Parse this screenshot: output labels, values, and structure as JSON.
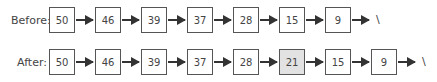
{
  "before": {
    "label": "Before:",
    "nodes": [
      "50",
      "46",
      "39",
      "37",
      "28",
      "15",
      "9"
    ],
    "terminator": "\\"
  },
  "after": {
    "label": "After:",
    "nodes": [
      "50",
      "46",
      "39",
      "37",
      "28",
      "21",
      "15",
      "9"
    ],
    "highlighted_index": 5,
    "terminator": "\\"
  },
  "colors": {
    "node_border": "#555555",
    "highlight_fill": "#e2e2e2",
    "arrow": "#333333"
  }
}
